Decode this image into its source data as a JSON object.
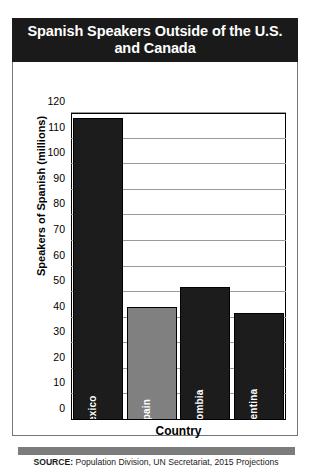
{
  "figure": {
    "title": "Spanish Speakers Outside of the U.S. and Canada",
    "source_prefix": "SOURCE:",
    "source_text": " Population Division, UN Secretariat, 2015 Projections"
  },
  "colors": {
    "banner_bg": "#1a1a1a",
    "banner_text": "#ffffff",
    "bar_dark": "#1c1c1c",
    "bar_light": "#808080",
    "gridline": "#9a9a9a",
    "frame": "#000000",
    "bottom_strip": "#7c7c7c"
  },
  "chart_data": {
    "type": "bar",
    "title": "Spanish Speakers Outside of the U.S. and Canada",
    "xlabel": "Country",
    "ylabel": "Speakers of Spanish (millions)",
    "categories": [
      "Mexico",
      "Spain",
      "Colombia",
      "Argentina"
    ],
    "values": [
      118,
      44,
      52,
      42
    ],
    "bar_colors": [
      "#1c1c1c",
      "#808080",
      "#1c1c1c",
      "#1c1c1c"
    ],
    "ylim": [
      0,
      120
    ],
    "ytick_step": 10,
    "yticks": [
      0,
      10,
      20,
      30,
      40,
      50,
      60,
      70,
      80,
      90,
      100,
      110,
      120
    ],
    "ytick_labels": [
      "0",
      "10",
      "20",
      "30",
      "40",
      "50",
      "60",
      "70",
      "80",
      "90",
      "100",
      "110",
      "120"
    ],
    "grid": true,
    "grid_axis": "y",
    "legend": false,
    "legend_position": "none",
    "bar_label_position": "inside-bottom-rotated",
    "source": "SOURCE: Population Division, UN Secretariat, 2015 Projections"
  }
}
